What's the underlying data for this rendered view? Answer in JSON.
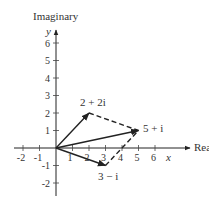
{
  "diagram": {
    "type": "complex-plane-vector-addition",
    "axes": {
      "x_label": "Real",
      "y_label": "Imaginary",
      "x_var": "x",
      "y_var": "y",
      "x_ticks": [
        "-2",
        "-1",
        "1",
        "2",
        "3",
        "4",
        "5",
        "6"
      ],
      "y_ticks": [
        "6",
        "5",
        "4",
        "3",
        "2",
        "1",
        "-1",
        "-2"
      ]
    },
    "vectors": [
      {
        "label": "2 + 2i",
        "re": 2,
        "im": 2,
        "style": "solid-arrow"
      },
      {
        "label": "3 − i",
        "re": 3,
        "im": -1,
        "style": "solid-arrow"
      },
      {
        "label": "5 + i",
        "re": 5,
        "im": 1,
        "style": "solid-arrow"
      }
    ],
    "parallelogram_edges": [
      {
        "from": "2 + 2i",
        "to": "5 + i",
        "style": "dashed"
      },
      {
        "from": "3 − i",
        "to": "5 + i",
        "style": "dashed"
      }
    ],
    "colors": {
      "stroke": "#222222",
      "text": "#333333",
      "background": "#ffffff"
    }
  }
}
